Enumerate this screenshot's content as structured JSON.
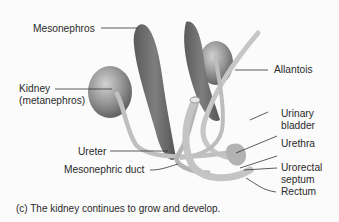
{
  "figure": {
    "labels": {
      "mesonephros": "Mesonephros",
      "kidney_line1": "Kidney",
      "kidney_line2": "(metanephros)",
      "allantois": "Allantois",
      "urinary_line1": "Urinary",
      "urinary_line2": "bladder",
      "urethra": "Urethra",
      "urorectal_line1": "Urorectal",
      "urorectal_line2": "septum",
      "rectum": "Rectum",
      "ureter": "Ureter",
      "mesonephric_duct": "Mesonephric duct"
    },
    "caption": "(c) The kidney continues to grow and develop.",
    "colors": {
      "organ_dark": "#6a6a6a",
      "organ_mid": "#9a9a9a",
      "organ_light": "#c8c8c8",
      "tube": "#bdbdbd",
      "leader_line": "#333333"
    }
  }
}
